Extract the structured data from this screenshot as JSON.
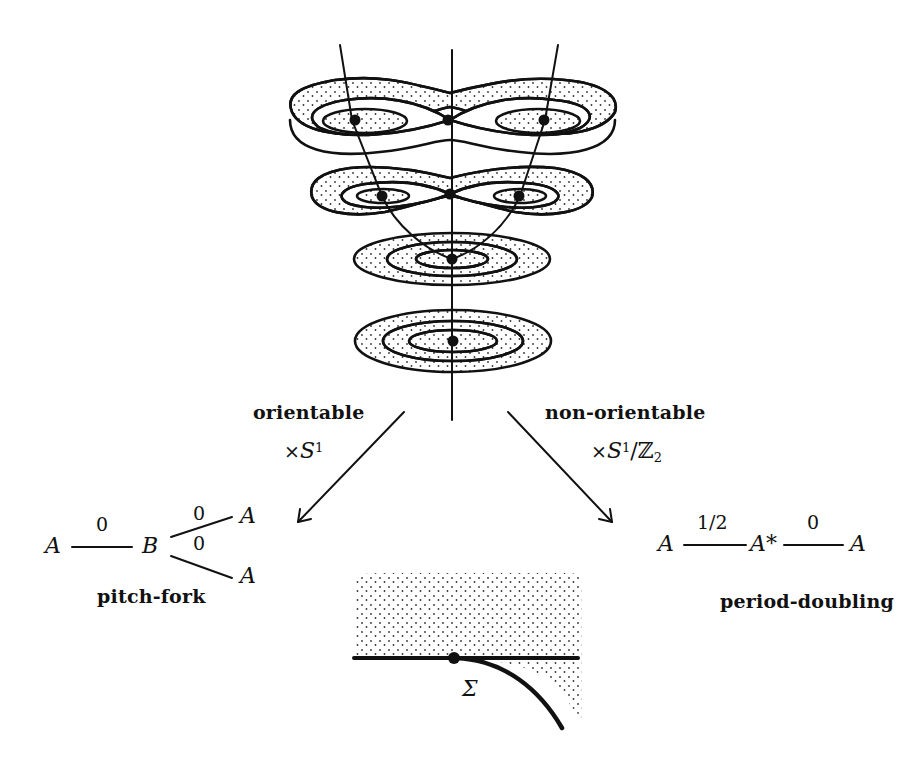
{
  "figure": {
    "type": "bifurcation-diagram",
    "stack": {
      "levels": 4,
      "top_level": "figure-eight with two centers and one saddle",
      "bottom_level": "nested ovals with one center"
    }
  },
  "branches": {
    "left": {
      "label": "orientable",
      "operation": {
        "prefix": "×",
        "base": "S",
        "sup": "1",
        "rest": "",
        "sub": ""
      },
      "graph": {
        "nodes": [
          "A",
          "B",
          "A",
          "A"
        ],
        "edge_labels": [
          "0",
          "0",
          "0"
        ]
      },
      "name": "pitch-fork"
    },
    "right": {
      "label": "non-orientable",
      "operation": {
        "prefix": "×",
        "base": "S",
        "sup": "1",
        "rest": "/ℤ",
        "sub": "2"
      },
      "graph": {
        "nodes": [
          "A",
          "A*",
          "A"
        ],
        "edge_labels": [
          "1/2",
          "0"
        ]
      },
      "name": "period-doubling"
    }
  },
  "bottom_inset": {
    "label": "Σ"
  },
  "colors": {
    "ink": "#111111",
    "background": "#ffffff"
  }
}
